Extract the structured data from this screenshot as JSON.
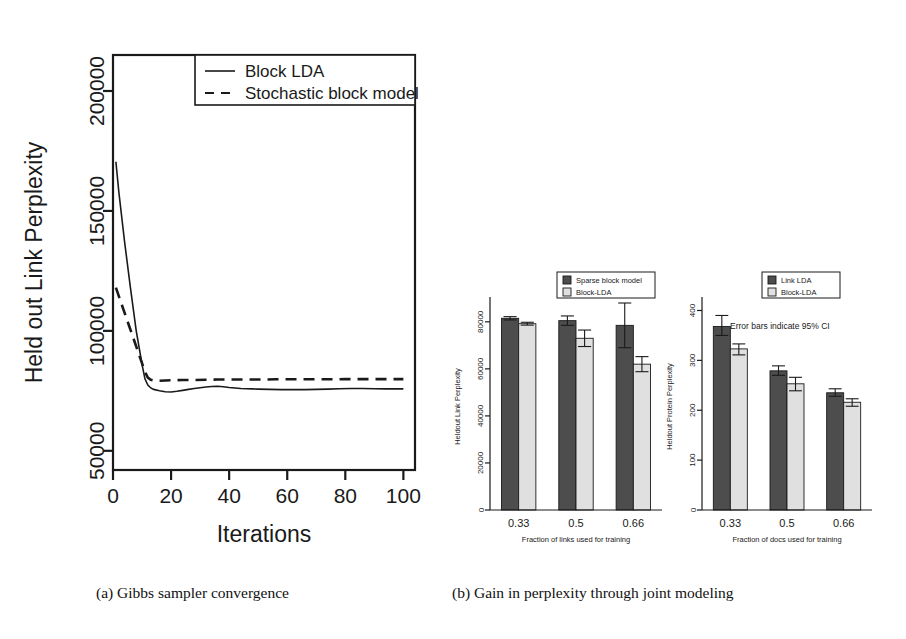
{
  "figure": {
    "panel_a_caption": "(a) Gibbs sampler convergence",
    "panel_b_caption": "(b) Gain in perplexity through joint modeling"
  },
  "colors": {
    "axis": "#1a1a1a",
    "dark_bar": "#4d4d4d",
    "light_bar": "#e0e0e0",
    "background": "#ffffff"
  },
  "chart_data": [
    {
      "id": "gibbs-convergence",
      "type": "line",
      "title": "",
      "xlabel": "Iterations",
      "ylabel": "Held out Link Perplexity",
      "xlim": [
        0,
        104
      ],
      "ylim": [
        42000,
        215000
      ],
      "xticks": [
        0,
        20,
        40,
        60,
        80,
        100
      ],
      "xticklabels": [
        "0",
        "20",
        "40",
        "60",
        "80",
        "100"
      ],
      "yticks": [
        50000,
        100000,
        150000,
        200000
      ],
      "yticklabels": [
        "50000",
        "100000",
        "150000",
        "200000"
      ],
      "grid": false,
      "legend_position": "top-right",
      "series": [
        {
          "name": "Block LDA",
          "style": "solid",
          "x": [
            1,
            2,
            4,
            6,
            8,
            10,
            11,
            12,
            13,
            14,
            16,
            18,
            20,
            22,
            24,
            26,
            28,
            30,
            32,
            34,
            36,
            38,
            40,
            42,
            44,
            46,
            48,
            50,
            54,
            58,
            62,
            66,
            70,
            74,
            78,
            82,
            86,
            90,
            94,
            98,
            100
          ],
          "y": [
            170500,
            158000,
            137000,
            118000,
            100000,
            86000,
            80000,
            77400,
            76200,
            75600,
            75000,
            74600,
            74500,
            74800,
            75200,
            75600,
            76000,
            76300,
            76600,
            76800,
            76900,
            76700,
            76400,
            76200,
            76000,
            75900,
            75800,
            75700,
            75600,
            75500,
            75500,
            75500,
            75600,
            75700,
            75900,
            76000,
            76000,
            75900,
            75800,
            75800,
            75800
          ]
        },
        {
          "name": "Stochastic block model",
          "style": "dashed",
          "x": [
            1,
            3,
            5,
            7,
            9,
            11,
            12,
            13,
            14,
            16,
            18,
            20,
            24,
            28,
            32,
            36,
            40,
            44,
            48,
            52,
            56,
            60,
            64,
            68,
            72,
            76,
            80,
            84,
            88,
            92,
            96,
            100
          ],
          "y": [
            118000,
            111000,
            104000,
            97000,
            90000,
            83000,
            80500,
            79600,
            79300,
            79200,
            79300,
            79400,
            79500,
            79500,
            79600,
            79700,
            79700,
            79700,
            79700,
            79700,
            79800,
            79800,
            79800,
            79800,
            79800,
            79800,
            79900,
            79900,
            79900,
            79900,
            79900,
            79900
          ]
        }
      ]
    },
    {
      "id": "heldout-link-perplexity",
      "type": "bar",
      "title": "",
      "xlabel": "Fraction of links used for training",
      "ylabel": "Heldout Link Perplexity",
      "categories": [
        "0.33",
        "0.5",
        "0.66"
      ],
      "yticks": [
        0,
        20000,
        40000,
        60000,
        80000
      ],
      "yticklabels": [
        "0",
        "20000",
        "40000",
        "60000",
        "80000"
      ],
      "ylim": [
        0,
        88000
      ],
      "grid": false,
      "legend_position": "top-right",
      "error_bars": true,
      "series": [
        {
          "name": "Sparse block model",
          "fill": "dark",
          "values": [
            81500,
            80500,
            78500
          ],
          "err_low": [
            80800,
            78500,
            69000
          ],
          "err_high": [
            82200,
            82500,
            88000
          ]
        },
        {
          "name": "Block-LDA",
          "fill": "light",
          "values": [
            79200,
            73000,
            62000
          ],
          "err_low": [
            78600,
            69500,
            58800
          ],
          "err_high": [
            79800,
            76500,
            65200
          ]
        }
      ]
    },
    {
      "id": "heldout-protein-perplexity",
      "type": "bar",
      "title": "",
      "xlabel": "Fraction of docs used for training",
      "ylabel": "Heldout Protein Perplexity",
      "annotation": "Error bars indicate 95% CI",
      "categories": [
        "0.33",
        "0.5",
        "0.66"
      ],
      "yticks": [
        0,
        100,
        200,
        300,
        400
      ],
      "yticklabels": [
        "0",
        "100",
        "200",
        "300",
        "400"
      ],
      "ylim": [
        0,
        415
      ],
      "grid": false,
      "legend_position": "top-right",
      "error_bars": true,
      "series": [
        {
          "name": "Link LDA",
          "fill": "dark",
          "values": [
            368,
            279,
            235
          ],
          "err_low": [
            350,
            270,
            228
          ],
          "err_high": [
            390,
            289,
            243
          ]
        },
        {
          "name": "Block-LDA",
          "fill": "light",
          "values": [
            323,
            253,
            216
          ],
          "err_low": [
            311,
            239,
            208
          ],
          "err_high": [
            333,
            266,
            223
          ]
        }
      ]
    }
  ]
}
